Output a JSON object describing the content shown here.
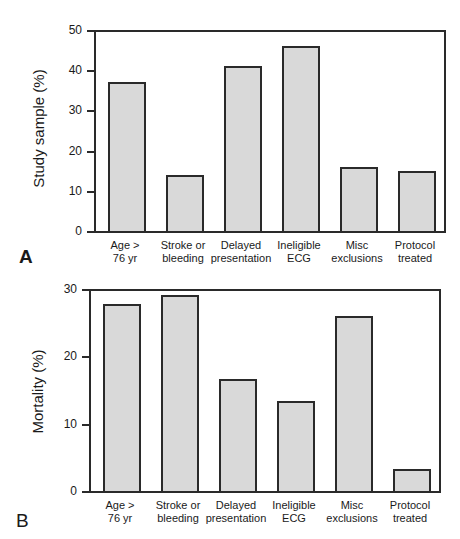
{
  "chart_data": [
    {
      "panel": "A",
      "type": "bar",
      "title": "",
      "xlabel": "",
      "ylabel": "Study sample (%)",
      "ylim": [
        0,
        50
      ],
      "yticks": [
        0,
        10,
        20,
        30,
        40,
        50
      ],
      "grid": false,
      "categories": [
        "Age > 76 yr",
        "Stroke or bleeding",
        "Delayed presentation",
        "Ineligible ECG",
        "Misc exclusions",
        "Protocol treated"
      ],
      "category_lines": [
        [
          "Age >",
          "76 yr"
        ],
        [
          "Stroke or",
          "bleeding"
        ],
        [
          "Delayed",
          "presentation"
        ],
        [
          "Ineligible",
          "ECG"
        ],
        [
          "Misc",
          "exclusions"
        ],
        [
          "Protocol",
          "treated"
        ]
      ],
      "values": [
        37,
        14,
        41,
        46,
        16,
        15
      ],
      "fill_color": "#d9d9d9",
      "edge_color": "#2a2a2a"
    },
    {
      "panel": "B",
      "type": "bar",
      "title": "",
      "xlabel": "",
      "ylabel": "Mortality (%)",
      "ylim": [
        0,
        30
      ],
      "yticks": [
        0,
        10,
        20,
        30
      ],
      "grid": false,
      "categories": [
        "Age > 76 yr",
        "Stroke or bleeding",
        "Delayed presentation",
        "Ineligible ECG",
        "Misc exclusions",
        "Protocol treated"
      ],
      "category_lines": [
        [
          "Age >",
          "76 yr"
        ],
        [
          "Stroke or",
          "bleeding"
        ],
        [
          "Delayed",
          "presentation"
        ],
        [
          "Ineligible",
          "ECG"
        ],
        [
          "Misc",
          "exclusions"
        ],
        [
          "Protocol",
          "treated"
        ]
      ],
      "values": [
        27.7,
        29.1,
        16.6,
        13.4,
        26,
        3.3
      ],
      "fill_color": "#d9d9d9",
      "edge_color": "#2a2a2a"
    }
  ],
  "panels": {
    "A": {
      "letter": "A"
    },
    "B": {
      "letter": "B"
    }
  }
}
